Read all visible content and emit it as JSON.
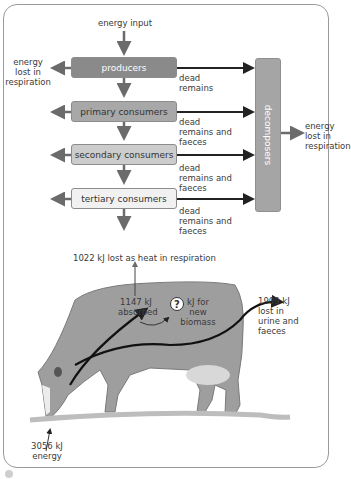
{
  "food_chain": {
    "energy_input": "energy input",
    "left_loss": [
      "energy",
      "lost in",
      "respiration"
    ],
    "levels": [
      {
        "label": "producers",
        "fill": "#8a8a8a",
        "text_color": "#ffffff"
      },
      {
        "label": "primary consumers",
        "fill": "#a8a8a8",
        "text_color": "#333333"
      },
      {
        "label": "secondary consumers",
        "fill": "#cccccc",
        "text_color": "#333333"
      },
      {
        "label": "tertiary consumers",
        "fill": "#f1f1f1",
        "text_color": "#333333"
      }
    ],
    "dead_labels": [
      [
        "dead",
        "remains"
      ],
      [
        "dead",
        "remains and",
        "faeces"
      ],
      [
        "dead",
        "remains and",
        "faeces"
      ],
      [
        "dead",
        "remains and",
        "faeces"
      ]
    ],
    "decomposers": "decomposers",
    "decomposer_loss": [
      "energy",
      "lost in",
      "respiration"
    ]
  },
  "cow": {
    "heat_loss": "1022 kJ lost as heat in respiration",
    "absorbed": [
      "1147 kJ",
      "absorbed"
    ],
    "biomass_symbol": "?",
    "biomass": [
      "kJ for",
      "new",
      "biomass"
    ],
    "urine": [
      "1909 kJ",
      "lost in",
      "urine and",
      "faeces"
    ],
    "intake": [
      "3056 kJ",
      "energy"
    ]
  }
}
